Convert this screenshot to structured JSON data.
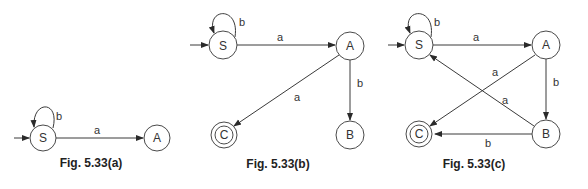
{
  "figures": [
    {
      "id": "a",
      "caption": "Fig. 5.33(a)",
      "states": [
        {
          "name": "S",
          "initial": true,
          "final": false
        },
        {
          "name": "A",
          "initial": false,
          "final": false
        }
      ],
      "transitions": [
        {
          "from": "S",
          "to": "S",
          "label": "b"
        },
        {
          "from": "S",
          "to": "A",
          "label": "a"
        }
      ]
    },
    {
      "id": "b",
      "caption": "Fig. 5.33(b)",
      "states": [
        {
          "name": "S",
          "initial": true,
          "final": false
        },
        {
          "name": "A",
          "initial": false,
          "final": false
        },
        {
          "name": "C",
          "initial": false,
          "final": true
        },
        {
          "name": "B",
          "initial": false,
          "final": false
        }
      ],
      "transitions": [
        {
          "from": "S",
          "to": "S",
          "label": "b"
        },
        {
          "from": "S",
          "to": "A",
          "label": "a"
        },
        {
          "from": "A",
          "to": "C",
          "label": "a"
        },
        {
          "from": "A",
          "to": "B",
          "label": "b"
        }
      ]
    },
    {
      "id": "c",
      "caption": "Fig. 5.33(c)",
      "states": [
        {
          "name": "S",
          "initial": true,
          "final": false
        },
        {
          "name": "A",
          "initial": false,
          "final": false
        },
        {
          "name": "C",
          "initial": false,
          "final": true
        },
        {
          "name": "B",
          "initial": false,
          "final": false
        }
      ],
      "transitions": [
        {
          "from": "S",
          "to": "S",
          "label": "b"
        },
        {
          "from": "S",
          "to": "A",
          "label": "a"
        },
        {
          "from": "A",
          "to": "C",
          "label": "a"
        },
        {
          "from": "A",
          "to": "B",
          "label": "b"
        },
        {
          "from": "B",
          "to": "S",
          "label": "a"
        },
        {
          "from": "B",
          "to": "C",
          "label": "b"
        }
      ]
    }
  ]
}
